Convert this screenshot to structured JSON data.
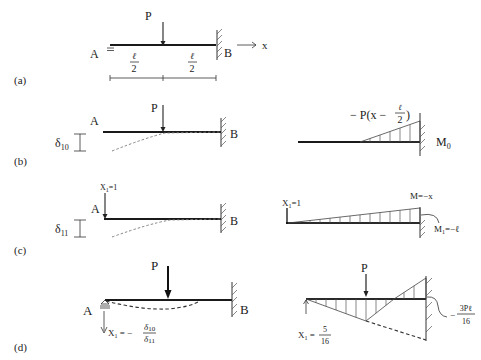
{
  "figure": {
    "panels": [
      {
        "id": "a",
        "label": "(a)",
        "support_left": "A",
        "support_right": "B",
        "load": "P",
        "axis": "x",
        "segments": [
          {
            "num": "ℓ",
            "den": "2"
          },
          {
            "num": "ℓ",
            "den": "2"
          }
        ]
      },
      {
        "id": "b",
        "label": "(b)",
        "support_left": "A",
        "support_right": "B",
        "load": "P",
        "deflection": "δ",
        "deflection_sub": "10",
        "moment_expr_prefix": "− P(x − ",
        "moment_expr_num": "ℓ",
        "moment_expr_den": "2",
        "moment_expr_suffix": ")",
        "moment_name": "M",
        "moment_sub": "0"
      },
      {
        "id": "c",
        "label": "(c)",
        "support_left": "A",
        "support_right": "B",
        "unit_load": "X",
        "unit_load_sub": "1",
        "unit_load_val": "=1",
        "deflection": "δ",
        "deflection_sub": "11",
        "moment_line": "M=−x",
        "moment_end_name": "M",
        "moment_end_sub": "1",
        "moment_end_val": "=−ℓ"
      },
      {
        "id": "d",
        "label": "(d)",
        "support_left": "A",
        "support_right": "B",
        "load": "P",
        "reaction_name": "X",
        "reaction_sub": "1",
        "reaction_eq": " = −",
        "reaction_num": "δ",
        "reaction_num_sub": "10",
        "reaction_den": "δ",
        "reaction_den_sub": "11",
        "moment_left_name": "X",
        "moment_left_sub": "1",
        "moment_left_eq": " = ",
        "moment_left_num": "5",
        "moment_left_den": "16",
        "moment_right_prefix": "−",
        "moment_right_num": "3Pℓ",
        "moment_right_den": "16"
      }
    ]
  }
}
